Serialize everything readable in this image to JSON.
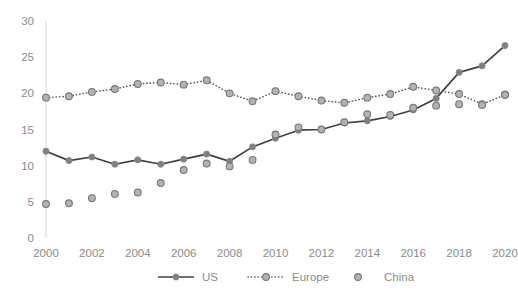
{
  "chart_data": {
    "type": "line",
    "title": "",
    "subtitle": "",
    "xlabel": "",
    "ylabel": "",
    "x": [
      2000,
      2001,
      2002,
      2003,
      2004,
      2005,
      2006,
      2007,
      2008,
      2009,
      2010,
      2011,
      2012,
      2013,
      2014,
      2015,
      2016,
      2017,
      2018,
      2019,
      2020
    ],
    "categories": [
      "2000",
      "2001",
      "2002",
      "2003",
      "2004",
      "2005",
      "2006",
      "2007",
      "2008",
      "2009",
      "2010",
      "2011",
      "2012",
      "2013",
      "2014",
      "2015",
      "2016",
      "2017",
      "2018",
      "2019",
      "2020"
    ],
    "series": [
      {
        "name": "US",
        "style": "solid-line-with-markers",
        "color": "#404040",
        "marker_color": "#808080",
        "values": [
          12.0,
          10.7,
          11.2,
          10.2,
          10.8,
          10.2,
          10.9,
          11.6,
          10.6,
          12.6,
          13.8,
          14.9,
          15.0,
          15.9,
          16.2,
          16.8,
          17.7,
          19.3,
          22.9,
          23.8,
          26.6
        ]
      },
      {
        "name": "Europe",
        "style": "dotted-line-with-markers",
        "color": "#595959",
        "marker_color": "#a6a6a6",
        "values": [
          19.4,
          19.6,
          20.2,
          20.6,
          21.3,
          21.5,
          21.2,
          21.8,
          20.0,
          18.9,
          20.3,
          19.6,
          19.0,
          18.7,
          19.4,
          19.9,
          20.9,
          20.4,
          19.9,
          18.5,
          19.8
        ]
      },
      {
        "name": "China",
        "style": "markers-only",
        "color": "#a6a6a6",
        "marker_color": "#a6a6a6",
        "values": [
          4.7,
          4.8,
          5.5,
          6.1,
          6.3,
          7.6,
          9.4,
          10.3,
          9.9,
          10.8,
          14.3,
          15.3,
          15.0,
          16.0,
          17.1,
          17.0,
          18.0,
          18.3,
          18.5,
          18.4,
          19.8
        ]
      }
    ],
    "ylim": [
      0,
      30
    ],
    "yticks": [
      0,
      5,
      10,
      15,
      20,
      25,
      30
    ],
    "ytick_labels": [
      "0",
      "5",
      "10",
      "15",
      "20",
      "25",
      "30"
    ],
    "xlim": [
      2000,
      2020
    ],
    "xticks": [
      2000,
      2002,
      2004,
      2006,
      2008,
      2010,
      2012,
      2014,
      2016,
      2018,
      2020
    ],
    "xtick_labels": [
      "2000",
      "2002",
      "2004",
      "2006",
      "2008",
      "2010",
      "2012",
      "2014",
      "2016",
      "2018",
      "2020"
    ],
    "grid": false,
    "legend_position": "bottom",
    "legend": [
      "US",
      "Europe",
      "China"
    ],
    "background": "#ffffff",
    "axis_color": "#d9d9d9",
    "tick_label_color": "#8c8c8c"
  }
}
